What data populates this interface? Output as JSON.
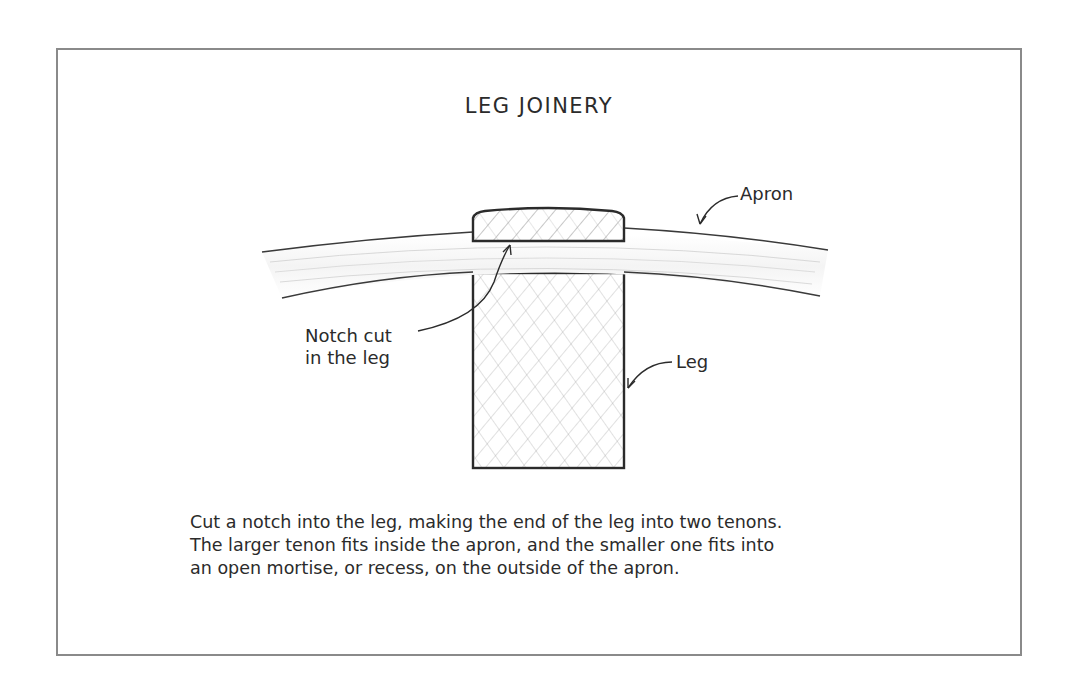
{
  "figure": {
    "title": "LEG JOINERY",
    "labels": {
      "apron": "Apron",
      "notch_line1": "Notch cut",
      "notch_line2": "in the leg",
      "leg": "Leg"
    },
    "caption": {
      "lines": [
        "Cut a notch into the leg, making the end of the leg into two tenons.",
        "The larger tenon fits inside the apron, and the smaller one fits into",
        "an open mortise, or recess, on the outside of the apron."
      ]
    },
    "colors": {
      "frame": "#8a8a8a",
      "ink": "#2b2b2b",
      "hatch": "#9a9a9a",
      "background": "#ffffff"
    }
  }
}
